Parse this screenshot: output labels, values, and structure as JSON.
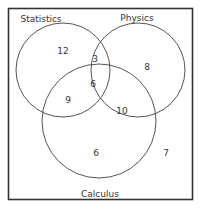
{
  "diagram": {
    "type": "venn-3",
    "sets": [
      {
        "name": "Statistics",
        "cx": 63,
        "cy": 70,
        "r": 47,
        "label_x": 40,
        "label_y": 20
      },
      {
        "name": "Physics",
        "cx": 138,
        "cy": 70,
        "r": 47,
        "label_x": 137,
        "label_y": 20
      },
      {
        "name": "Calculus",
        "cx": 99,
        "cy": 121,
        "r": 57,
        "label_x": 100,
        "label_y": 195
      }
    ],
    "regions": [
      {
        "id": "statistics-only",
        "value": "12",
        "x": 63,
        "y": 54
      },
      {
        "id": "statistics-physics",
        "value": "3",
        "x": 96,
        "y": 62
      },
      {
        "id": "physics-only",
        "value": "8",
        "x": 147,
        "y": 70
      },
      {
        "id": "all-three",
        "value": "6",
        "x": 93,
        "y": 86
      },
      {
        "id": "statistics-calculus",
        "value": "9",
        "x": 68,
        "y": 102
      },
      {
        "id": "physics-calculus",
        "value": "10",
        "x": 123,
        "y": 113
      },
      {
        "id": "calculus-only",
        "value": "6",
        "x": 97,
        "y": 155
      },
      {
        "id": "outside",
        "value": "7",
        "x": 166,
        "y": 155
      }
    ],
    "frame": {
      "x": 8,
      "y": 8,
      "width": 185,
      "height": 192
    },
    "stroke_color": "#444444"
  }
}
